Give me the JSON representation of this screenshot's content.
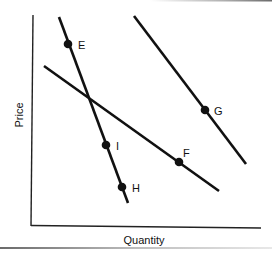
{
  "chart_data": {
    "type": "line",
    "title": "",
    "xlabel": "Quantity",
    "ylabel": "Price",
    "grid": false,
    "legend": null,
    "axes": {
      "origin_px": [
        33,
        226
      ],
      "x_end_px": [
        261,
        228
      ],
      "y_top_px": [
        33,
        16
      ]
    },
    "series": [
      {
        "name": "steep-curve",
        "description": "Steep downward-sloping line through E, I, H",
        "start_px": [
          59,
          17
        ],
        "end_px": [
          128,
          203
        ],
        "points": [
          "E",
          "I",
          "H"
        ]
      },
      {
        "name": "middle-curve",
        "description": "Flatter downward-sloping line through F",
        "start_px": [
          44,
          66
        ],
        "end_px": [
          219,
          191
        ],
        "points": [
          "F"
        ]
      },
      {
        "name": "right-curve",
        "description": "Downward-sloping line to the right through G",
        "start_px": [
          134,
          16
        ],
        "end_px": [
          246,
          164
        ],
        "points": [
          "G"
        ]
      }
    ],
    "points": [
      {
        "label": "E",
        "px": [
          68,
          44
        ],
        "label_px": [
          78,
          49
        ]
      },
      {
        "label": "G",
        "px": [
          205,
          110
        ],
        "label_px": [
          214,
          115
        ]
      },
      {
        "label": "I",
        "px": [
          106,
          145
        ],
        "label_px": [
          116,
          150
        ]
      },
      {
        "label": "F",
        "px": [
          179,
          162
        ],
        "label_px": [
          183,
          157
        ]
      },
      {
        "label": "H",
        "px": [
          122,
          187
        ],
        "label_px": [
          132,
          192
        ]
      }
    ],
    "annotations": [],
    "colors": {
      "line": "#111111",
      "point": "#111111",
      "axis": "#222222",
      "frame_top": "#8a8a8a",
      "frame_bottom": "#9a9a9a"
    }
  }
}
